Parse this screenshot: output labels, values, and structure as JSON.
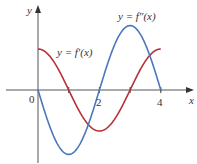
{
  "chart_data": {
    "type": "line",
    "title": "",
    "xlabel": "x",
    "ylabel": "y",
    "xlim": [
      -1.2,
      4.6
    ],
    "x_ticks": [
      0,
      1,
      2,
      3,
      4
    ],
    "x_tick_labels": [
      "0",
      "",
      "2",
      "",
      "4"
    ],
    "grid": false,
    "series": [
      {
        "name": "y = f'(x)",
        "color": "#b5323a",
        "x": [
          0,
          0.5,
          1,
          1.5,
          2,
          2.5,
          3,
          3.5,
          4
        ],
        "values": [
          1,
          0.71,
          0,
          -0.71,
          -1,
          -0.71,
          0,
          0.71,
          1
        ]
      },
      {
        "name": "y = f''(x)",
        "color": "#4a78bd",
        "x": [
          0,
          0.5,
          1,
          1.5,
          2,
          2.5,
          3,
          3.5,
          4
        ],
        "values": [
          0,
          -1.11,
          -1.57,
          -1.11,
          0,
          1.11,
          1.57,
          1.11,
          0
        ]
      }
    ]
  },
  "labels": {
    "y_axis": "y",
    "x_axis": "x",
    "origin": "0",
    "tick_2": "2",
    "tick_4": "4",
    "fprime_label": "y = f′(x)",
    "fdoubleprime_label": "y = f″(x)"
  }
}
